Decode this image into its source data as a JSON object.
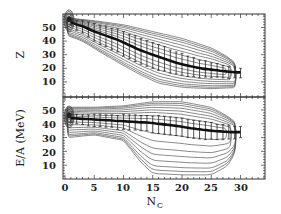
{
  "chart_data": [
    {
      "type": "line",
      "panel": "top",
      "title": "",
      "xlabel": "N_C",
      "ylabel": "Z",
      "xlim": [
        0,
        34
      ],
      "ylim": [
        0,
        59
      ],
      "xticks": [
        0,
        5,
        10,
        15,
        20,
        25,
        30
      ],
      "yticks": [
        10,
        20,
        30,
        40,
        50
      ],
      "grid": false,
      "legend": null,
      "series": [
        {
          "name": "mean Z",
          "style": "thick black line with vertical error bars",
          "x": [
            1,
            2,
            3,
            4,
            5,
            6,
            7,
            8,
            9,
            10,
            11,
            12,
            13,
            14,
            15,
            16,
            17,
            18,
            19,
            20,
            21,
            22,
            23,
            24,
            25,
            26,
            27,
            28,
            29,
            30
          ],
          "y": [
            54,
            52,
            51,
            49,
            47,
            45.5,
            44,
            42.5,
            41,
            39,
            37,
            35,
            33,
            31.5,
            30,
            28.5,
            27,
            25.5,
            24,
            23,
            22,
            21,
            20,
            19.5,
            19,
            18.5,
            18,
            17.5,
            17,
            17
          ],
          "yerr_low": [
            2,
            4,
            5,
            6,
            7,
            8,
            8,
            9,
            9,
            10,
            10,
            10,
            10,
            10,
            10,
            10,
            9,
            9,
            8,
            8,
            8,
            7,
            7,
            6,
            6,
            5,
            5,
            5,
            4,
            4
          ],
          "yerr_high": [
            2,
            3,
            4,
            5,
            6,
            6,
            7,
            7,
            8,
            8,
            8,
            9,
            9,
            9,
            9,
            9,
            9,
            8,
            8,
            8,
            7,
            7,
            6,
            6,
            5,
            5,
            4,
            4,
            4,
            3
          ]
        }
      ],
      "contours": {
        "description": "nested contour lines of event density; dense peak near Nc=0-1, Z=50-56; spreading to lower Z and higher Nc",
        "upper_edge": [
          [
            0.5,
            57
          ],
          [
            5,
            55
          ],
          [
            10,
            52
          ],
          [
            15,
            47
          ],
          [
            20,
            42
          ],
          [
            25,
            35
          ],
          [
            28,
            28
          ],
          [
            30,
            20
          ],
          [
            30,
            14
          ]
        ],
        "lower_edge": [
          [
            0.5,
            44
          ],
          [
            3,
            40
          ],
          [
            6,
            32
          ],
          [
            10,
            22
          ],
          [
            13,
            15
          ],
          [
            16,
            9
          ],
          [
            20,
            6
          ],
          [
            25,
            5
          ],
          [
            30,
            6
          ]
        ]
      }
    },
    {
      "type": "line",
      "panel": "bottom",
      "title": "",
      "xlabel": "N_C",
      "ylabel": "E/A (MeV)",
      "xlim": [
        0,
        34
      ],
      "ylim": [
        0,
        59
      ],
      "xticks": [
        0,
        5,
        10,
        15,
        20,
        25,
        30
      ],
      "xtick_labels": [
        "0",
        "5",
        "10",
        "15",
        "20",
        "25",
        "30"
      ],
      "yticks": [
        10,
        20,
        30,
        40,
        50
      ],
      "grid": false,
      "legend": null,
      "series": [
        {
          "name": "mean E/A",
          "style": "thick black line with vertical error bars",
          "x": [
            1,
            2,
            3,
            4,
            5,
            6,
            7,
            8,
            9,
            10,
            11,
            12,
            13,
            14,
            15,
            16,
            17,
            18,
            19,
            20,
            21,
            22,
            23,
            24,
            25,
            26,
            27,
            28,
            29,
            30
          ],
          "y": [
            44,
            44,
            43.5,
            43.5,
            43,
            43,
            42.5,
            42.5,
            42,
            42,
            41.5,
            41.5,
            41,
            41,
            40.5,
            40,
            39.5,
            39,
            38.5,
            38,
            37,
            36.5,
            36,
            35.5,
            35,
            34.5,
            34.5,
            34,
            34,
            34
          ],
          "yerr_low": [
            3,
            4,
            4,
            5,
            5,
            5,
            5,
            5,
            6,
            6,
            6,
            6,
            6,
            6,
            7,
            7,
            7,
            7,
            7,
            7,
            7,
            7,
            7,
            7,
            6,
            6,
            6,
            5,
            5,
            4
          ],
          "yerr_high": [
            3,
            3,
            3,
            3,
            4,
            4,
            4,
            4,
            4,
            5,
            5,
            5,
            5,
            5,
            5,
            6,
            6,
            6,
            6,
            6,
            6,
            6,
            6,
            6,
            6,
            5,
            5,
            5,
            4,
            4
          ]
        }
      ],
      "contours": {
        "description": "nested contour lines of event density; dense peak near Nc=0-1, E/A=35-50; fans out toward high Nc, lower contours reach E/A~5 around Nc=13-27",
        "upper_edge": [
          [
            0.5,
            52
          ],
          [
            5,
            52
          ],
          [
            10,
            53
          ],
          [
            15,
            56
          ],
          [
            20,
            56
          ],
          [
            25,
            52
          ],
          [
            28,
            45
          ],
          [
            30,
            38
          ]
        ],
        "lower_edge": [
          [
            0.5,
            30
          ],
          [
            5,
            32
          ],
          [
            10,
            28
          ],
          [
            13,
            12
          ],
          [
            15,
            4
          ],
          [
            20,
            3
          ],
          [
            25,
            3
          ],
          [
            28,
            10
          ],
          [
            30,
            28
          ]
        ]
      }
    }
  ],
  "axes": {
    "top": {
      "ylabel": "Z",
      "ytick_labels": [
        "50",
        "40",
        "30",
        "20",
        "10"
      ]
    },
    "bottom": {
      "ylabel": "E/A (MeV)",
      "ytick_labels": [
        "50",
        "40",
        "30",
        "20",
        "10"
      ],
      "xlabel_main": "N",
      "xlabel_sub": "C",
      "xtick_labels": [
        "0",
        "5",
        "10",
        "15",
        "20",
        "25",
        "30"
      ]
    }
  }
}
